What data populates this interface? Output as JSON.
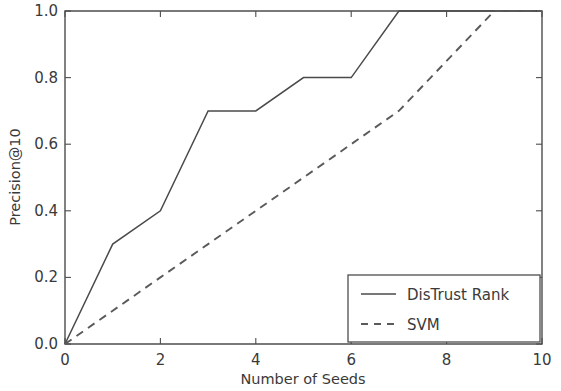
{
  "chart_data": {
    "type": "line",
    "title": "",
    "xlabel": "Number of Seeds",
    "ylabel": "Precision@10",
    "xlim": [
      0,
      10
    ],
    "ylim": [
      0,
      1.0
    ],
    "xticks": [
      0,
      2,
      4,
      6,
      8,
      10
    ],
    "xtick_labels": [
      "0",
      "2",
      "4",
      "6",
      "8",
      "10"
    ],
    "yticks": [
      0.0,
      0.2,
      0.4,
      0.6,
      0.8,
      1.0
    ],
    "ytick_labels": [
      "0.0",
      "0.2",
      "0.4",
      "0.6",
      "0.8",
      "1.0"
    ],
    "grid": false,
    "legend_position": "lower right",
    "series": [
      {
        "name": "DisTrust Rank",
        "style": "solid",
        "color": "#4a4a4a",
        "x": [
          0,
          1,
          2,
          3,
          4,
          5,
          6,
          7,
          8,
          9,
          10
        ],
        "values": [
          0.0,
          0.3,
          0.4,
          0.7,
          0.7,
          0.8,
          0.8,
          1.0,
          1.0,
          1.0,
          1.0
        ]
      },
      {
        "name": "SVM",
        "style": "dashed",
        "color": "#5a5a5a",
        "x": [
          0,
          1,
          2,
          3,
          4,
          5,
          6,
          7,
          8,
          9,
          10
        ],
        "values": [
          0.0,
          0.1,
          0.2,
          0.3,
          0.4,
          0.5,
          0.6,
          0.7,
          0.85,
          1.0,
          1.0
        ]
      }
    ]
  },
  "legend": {
    "entries": [
      {
        "label": "DisTrust Rank",
        "style": "solid"
      },
      {
        "label": "SVM",
        "style": "dashed"
      }
    ]
  },
  "axes": {
    "x_title": "Number of Seeds",
    "y_title": "Precision@10",
    "x_labels": [
      "0",
      "2",
      "4",
      "6",
      "8",
      "10"
    ],
    "y_labels": [
      "0.0",
      "0.2",
      "0.4",
      "0.6",
      "0.8",
      "1.0"
    ]
  }
}
